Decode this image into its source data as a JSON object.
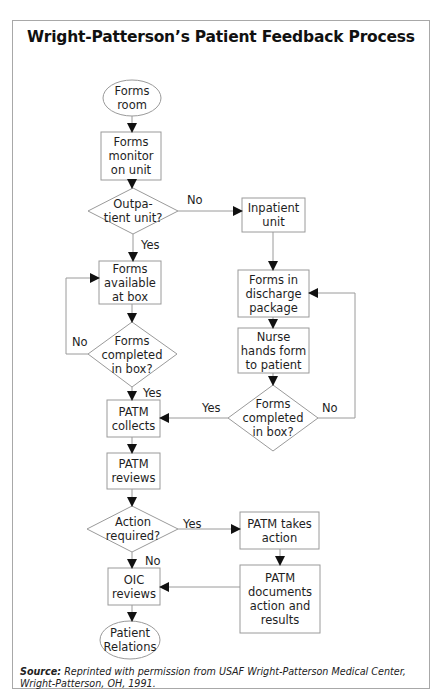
{
  "title": "Wright-Patterson’s Patient Feedback Process",
  "nodes": {
    "forms_room": {
      "type": "terminal",
      "label": "Forms room"
    },
    "forms_monitor": {
      "type": "process",
      "label": "Forms monitor on unit"
    },
    "outpatient_decision": {
      "type": "decision",
      "label": "Outpa- tient unit?"
    },
    "inpatient_unit": {
      "type": "process",
      "label": "Inpatient unit"
    },
    "forms_available": {
      "type": "process",
      "label": "Forms available at box"
    },
    "forms_completed_left": {
      "type": "decision",
      "label": "Forms completed in box?"
    },
    "forms_discharge": {
      "type": "process",
      "label": "Forms in discharge package"
    },
    "nurse_hands": {
      "type": "process",
      "label": "Nurse hands form to patient"
    },
    "forms_completed_right": {
      "type": "decision",
      "label": "Forms completed in box?"
    },
    "patm_collects": {
      "type": "process",
      "label": "PATM collects"
    },
    "patm_reviews": {
      "type": "process",
      "label": "PATM reviews"
    },
    "action_required": {
      "type": "decision",
      "label": "Action required?"
    },
    "patm_takes_action": {
      "type": "process",
      "label": "PATM takes action"
    },
    "patm_documents": {
      "type": "process",
      "label": "PATM documents action and results"
    },
    "oic_reviews": {
      "type": "process",
      "label": "OIC reviews"
    },
    "patient_relations": {
      "type": "terminal",
      "label": "Patient Relations"
    }
  },
  "edges": {
    "outpatient_no": "No",
    "outpatient_yes": "Yes",
    "left_completed_no": "No",
    "left_completed_yes": "Yes",
    "right_completed_yes": "Yes",
    "right_completed_no": "No",
    "action_yes": "Yes",
    "action_no": "No"
  },
  "edge_list": [
    [
      "forms_room",
      "forms_monitor",
      ""
    ],
    [
      "forms_monitor",
      "outpatient_decision",
      ""
    ],
    [
      "outpatient_decision",
      "inpatient_unit",
      "No"
    ],
    [
      "outpatient_decision",
      "forms_available",
      "Yes"
    ],
    [
      "forms_available",
      "forms_completed_left",
      ""
    ],
    [
      "forms_completed_left",
      "forms_available",
      "No"
    ],
    [
      "forms_completed_left",
      "patm_collects",
      "Yes"
    ],
    [
      "inpatient_unit",
      "forms_discharge",
      ""
    ],
    [
      "forms_discharge",
      "nurse_hands",
      ""
    ],
    [
      "nurse_hands",
      "forms_completed_right",
      ""
    ],
    [
      "forms_completed_right",
      "patm_collects",
      "Yes"
    ],
    [
      "forms_completed_right",
      "forms_discharge",
      "No"
    ],
    [
      "patm_collects",
      "patm_reviews",
      ""
    ],
    [
      "patm_reviews",
      "action_required",
      ""
    ],
    [
      "action_required",
      "patm_takes_action",
      "Yes"
    ],
    [
      "action_required",
      "oic_reviews",
      "No"
    ],
    [
      "patm_takes_action",
      "patm_documents",
      ""
    ],
    [
      "patm_documents",
      "oic_reviews",
      ""
    ],
    [
      "oic_reviews",
      "patient_relations",
      ""
    ]
  ],
  "source": {
    "label": "Source:",
    "text": " Reprinted with permission from USAF Wright-Patterson Medical Center, Wright-Patterson, OH, 1991."
  },
  "colors": {
    "stroke": "#9a9a9a",
    "arrow": "#111111",
    "text": "#1e1e1e"
  }
}
